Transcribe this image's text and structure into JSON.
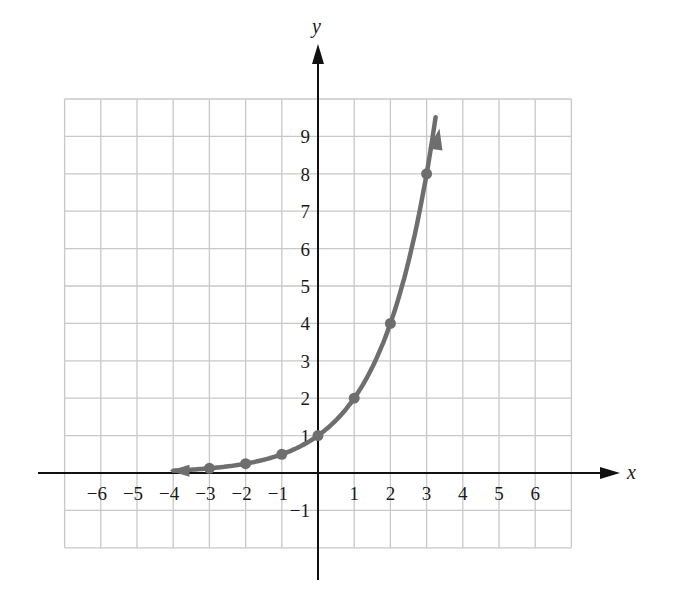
{
  "chart_data": {
    "type": "line",
    "title": "",
    "function": "y = 2^x",
    "xlabel": "x",
    "ylabel": "y",
    "xlim": [
      -7,
      7
    ],
    "ylim": [
      -2,
      10
    ],
    "grid": true,
    "x_tick_labels": [
      "−6",
      "−5",
      "−4",
      "−3",
      "−2",
      "−1",
      "1",
      "2",
      "3",
      "4",
      "5",
      "6"
    ],
    "x_tick_values": [
      -6,
      -5,
      -4,
      -3,
      -2,
      -1,
      1,
      2,
      3,
      4,
      5,
      6
    ],
    "y_tick_labels": [
      "−1",
      "1",
      "2",
      "3",
      "4",
      "5",
      "6",
      "7",
      "8",
      "9"
    ],
    "y_tick_values": [
      -1,
      1,
      2,
      3,
      4,
      5,
      6,
      7,
      8,
      9
    ],
    "series": [
      {
        "name": "y = 2^x",
        "color": "#6e6e6e",
        "points": [
          {
            "x": -3,
            "y": 0.125
          },
          {
            "x": -2,
            "y": 0.25
          },
          {
            "x": -1,
            "y": 0.5
          },
          {
            "x": 0,
            "y": 1
          },
          {
            "x": 1,
            "y": 2
          },
          {
            "x": 2,
            "y": 4
          },
          {
            "x": 3,
            "y": 8
          }
        ],
        "curve_range": [
          -4,
          3.25
        ],
        "arrows": [
          "left",
          "up-right"
        ]
      }
    ]
  },
  "labels": {
    "x_axis": "x",
    "y_axis": "y"
  },
  "colors": {
    "grid": "#c8c8c8",
    "axis": "#111111",
    "curve": "#6e6e6e"
  }
}
